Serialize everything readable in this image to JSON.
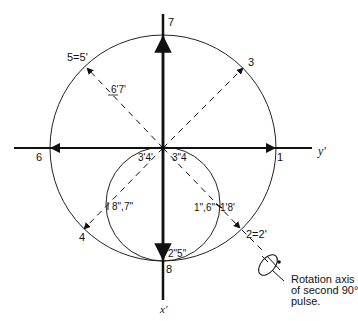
{
  "axes": {
    "top_label": "7",
    "right_label": "y'",
    "bottom_label": "x'"
  },
  "points": {
    "p1": "1",
    "p2": "2=2'",
    "p3": "3",
    "p4": "4",
    "p5": "5=5'",
    "p6": "6",
    "p8": "8",
    "p6p7p": "6'7'",
    "p3p4p": "3'4'",
    "p3pp4": "3\"4",
    "p8pp7pp": "8\",7\"",
    "p1pp6pp": "1\",6\"",
    "p1p8p": "1'8'",
    "p2pp5pp": "2\"5\""
  },
  "annotation": {
    "line1": "Rotation axis",
    "line2": "of second 90°",
    "line3": "pulse."
  },
  "colors": {
    "ink": "#111111",
    "background": "#ffffff"
  }
}
